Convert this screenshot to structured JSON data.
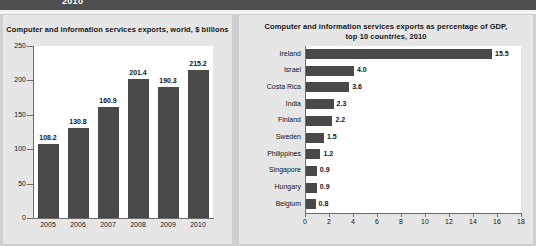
{
  "banner": {
    "text": "2010"
  },
  "left_panel": {
    "title": "Computer and information services exports, world, $ billions"
  },
  "right_panel": {
    "title_line1": "Computer and information services exports as percentage of GDP,",
    "title_line2": "top 10 countries, 2010"
  },
  "colors": {
    "bar": "#494949",
    "panel": "#e6e6e6",
    "plot": "#ffffff",
    "banner": "#4f4f4f",
    "page": "#cfcfcf"
  },
  "chart_data": [
    {
      "type": "bar",
      "title": "Computer and information services exports, world, $ billions",
      "xlabel": "",
      "ylabel": "",
      "categories": [
        "2005",
        "2006",
        "2007",
        "2008",
        "2009",
        "2010"
      ],
      "values": [
        108.2,
        130.8,
        160.9,
        201.4,
        190.3,
        215.2
      ],
      "value_labels": [
        "108.2",
        "130.8",
        "160.9",
        "201.4",
        "190.3",
        "215.2"
      ],
      "ylim": [
        0,
        250
      ],
      "yticks": [
        0,
        50,
        100,
        150,
        200,
        250
      ],
      "ytick_labels": [
        "0",
        "50",
        "100",
        "150",
        "200",
        "250"
      ],
      "grid": false,
      "orientation": "vertical",
      "legend": null
    },
    {
      "type": "bar",
      "title": "Computer and information services exports as percentage of GDP, top 10 countries, 2010",
      "xlabel": "",
      "ylabel": "",
      "orientation": "horizontal",
      "categories": [
        "Ireland",
        "Israel",
        "Costa Rica",
        "India",
        "Finland",
        "Sweden",
        "Philippines",
        "Singapore",
        "Hungary",
        "Belgium"
      ],
      "values": [
        15.5,
        4.0,
        3.6,
        2.3,
        2.2,
        1.5,
        1.2,
        0.9,
        0.9,
        0.8
      ],
      "value_labels": [
        "15.5",
        "4.0",
        "3.6",
        "2.3",
        "2.2",
        "1.5",
        "1.2",
        "0.9",
        "0.9",
        "0.8"
      ],
      "xlim": [
        0,
        18
      ],
      "xticks": [
        0,
        2,
        4,
        6,
        8,
        10,
        12,
        14,
        16,
        18
      ],
      "xtick_labels": [
        "0",
        "2",
        "4",
        "6",
        "8",
        "10",
        "12",
        "14",
        "16",
        "18"
      ],
      "grid": false,
      "legend": null
    }
  ]
}
